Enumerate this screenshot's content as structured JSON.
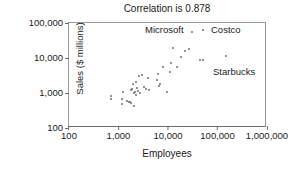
{
  "chart_data": {
    "type": "scatter",
    "title": "Correlation is 0.878",
    "xlabel": "Employees",
    "ylabel": "Sales ($ millions)",
    "xscale": "log",
    "yscale": "log",
    "xlim": [
      100,
      1000000
    ],
    "ylim": [
      100,
      100000
    ],
    "grid": false,
    "legend": "none",
    "xticklabels": [
      "100",
      "1,000",
      "10,000",
      "100,000",
      "1,000,000"
    ],
    "xtickvalues": [
      100,
      1000,
      10000,
      100000,
      1000000
    ],
    "yticklabels": [
      "100",
      "1,000",
      "10,000",
      "100,000"
    ],
    "ytickvalues": [
      100,
      1000,
      10000,
      100000
    ],
    "series": [
      {
        "name": "Companies",
        "marker_color": "#6e6e6e",
        "points": [
          {
            "x": 700,
            "y": 800
          },
          {
            "x": 720,
            "y": 690
          },
          {
            "x": 1150,
            "y": 470
          },
          {
            "x": 1200,
            "y": 660
          },
          {
            "x": 1250,
            "y": 1050
          },
          {
            "x": 1500,
            "y": 600
          },
          {
            "x": 1600,
            "y": 540
          },
          {
            "x": 1700,
            "y": 560
          },
          {
            "x": 1750,
            "y": 1250
          },
          {
            "x": 1800,
            "y": 530
          },
          {
            "x": 1900,
            "y": 1300
          },
          {
            "x": 2000,
            "y": 1750
          },
          {
            "x": 2050,
            "y": 420
          },
          {
            "x": 2100,
            "y": 980
          },
          {
            "x": 2200,
            "y": 1100
          },
          {
            "x": 2250,
            "y": 2100
          },
          {
            "x": 2300,
            "y": 900
          },
          {
            "x": 2400,
            "y": 1400
          },
          {
            "x": 2500,
            "y": 1150
          },
          {
            "x": 2600,
            "y": 3100
          },
          {
            "x": 2700,
            "y": 1000
          },
          {
            "x": 3000,
            "y": 3300
          },
          {
            "x": 3200,
            "y": 1450
          },
          {
            "x": 3600,
            "y": 1300
          },
          {
            "x": 4000,
            "y": 2700
          },
          {
            "x": 4200,
            "y": 1250
          },
          {
            "x": 6000,
            "y": 2300
          },
          {
            "x": 6300,
            "y": 3400
          },
          {
            "x": 6500,
            "y": 1550
          },
          {
            "x": 7000,
            "y": 1750
          },
          {
            "x": 8000,
            "y": 5700
          },
          {
            "x": 9500,
            "y": 1050
          },
          {
            "x": 11000,
            "y": 3900
          },
          {
            "x": 11500,
            "y": 7200
          },
          {
            "x": 12500,
            "y": 19000
          },
          {
            "x": 15000,
            "y": 5500
          },
          {
            "x": 18000,
            "y": 11000
          },
          {
            "x": 22000,
            "y": 16000
          },
          {
            "x": 27000,
            "y": 18500
          },
          {
            "x": 45000,
            "y": 9000
          },
          {
            "x": 52000,
            "y": 8800
          },
          {
            "x": 150000,
            "y": 11500
          }
        ]
      }
    ],
    "annotations": [
      {
        "label": "Microsoft",
        "marker": true
      },
      {
        "label": "Costco",
        "marker": true
      },
      {
        "label": "Starbucks",
        "marker": false
      }
    ]
  }
}
